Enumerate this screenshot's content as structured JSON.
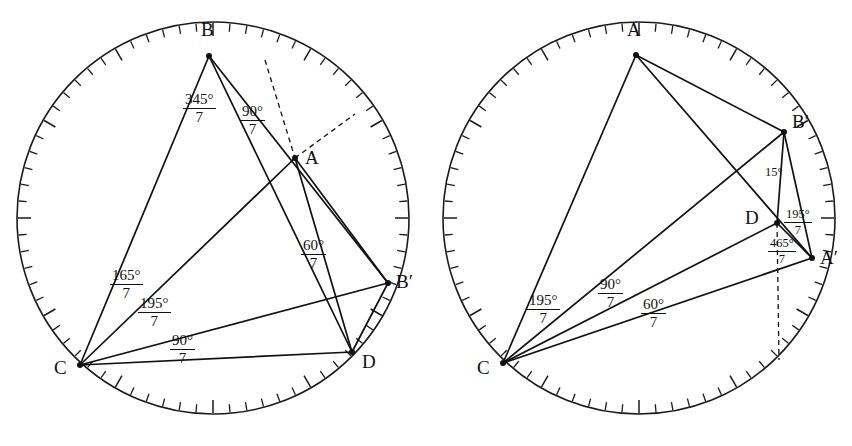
{
  "figure": {
    "stroke_color": "#111111",
    "background": "#ffffff",
    "width": 852,
    "height": 446
  },
  "left": {
    "name": "left-diagram",
    "circle": {
      "cx": 213,
      "cy": 218,
      "r": 196,
      "ticks": 72
    },
    "vertices": [
      {
        "id": "B",
        "label": "B",
        "x": 209,
        "y": 56,
        "lx": 201,
        "ly": 20
      },
      {
        "id": "A",
        "label": "A",
        "x": 295,
        "y": 158,
        "lx": 305,
        "ly": 148
      },
      {
        "id": "Bp",
        "label": "B′",
        "x": 388,
        "y": 283,
        "lx": 396,
        "ly": 272
      },
      {
        "id": "D",
        "label": "D",
        "x": 352,
        "y": 352,
        "lx": 362,
        "ly": 352
      },
      {
        "id": "C",
        "label": "C",
        "x": 80,
        "y": 365,
        "lx": 54,
        "ly": 358
      }
    ],
    "labels": [
      {
        "name": "angle-345-7",
        "numerator": "345°",
        "denominator": "7",
        "x": 183,
        "y": 92
      },
      {
        "name": "angle-90-7-b",
        "numerator": "90°",
        "denominator": "7",
        "x": 240,
        "y": 104
      },
      {
        "name": "angle-60-7",
        "numerator": "60°",
        "denominator": "7",
        "x": 301,
        "y": 238
      },
      {
        "name": "angle-165-7",
        "numerator": "165°",
        "denominator": "7",
        "x": 110,
        "y": 268
      },
      {
        "name": "angle-195-7",
        "numerator": "195°",
        "denominator": "7",
        "x": 138,
        "y": 296
      },
      {
        "name": "angle-90-7-c",
        "numerator": "90°",
        "denominator": "7",
        "x": 170,
        "y": 333
      }
    ]
  },
  "right": {
    "name": "right-diagram",
    "circle": {
      "cx": 639,
      "cy": 218,
      "r": 196,
      "ticks": 72
    },
    "vertices": [
      {
        "id": "A",
        "label": "A",
        "x": 636,
        "y": 55,
        "lx": 627,
        "ly": 20
      },
      {
        "id": "Bp",
        "label": "B′",
        "x": 784,
        "y": 132,
        "lx": 792,
        "ly": 112
      },
      {
        "id": "D",
        "label": "D",
        "x": 777,
        "y": 223,
        "lx": 745,
        "ly": 208
      },
      {
        "id": "Ap",
        "label": "A′",
        "x": 812,
        "y": 258,
        "lx": 820,
        "ly": 248
      },
      {
        "id": "C",
        "label": "C",
        "x": 503,
        "y": 363,
        "lx": 477,
        "ly": 358
      }
    ],
    "labels": [
      {
        "name": "angle-15",
        "text": "15°",
        "x": 765,
        "y": 165
      },
      {
        "name": "angle-195-7-d",
        "numerator": "195°",
        "denominator": "7",
        "x": 784,
        "y": 208
      },
      {
        "name": "angle-465-7",
        "numerator": "465°",
        "denominator": "7",
        "x": 768,
        "y": 237
      },
      {
        "name": "angle-195-7-c",
        "numerator": "195°",
        "denominator": "7",
        "x": 527,
        "y": 293
      },
      {
        "name": "angle-90-7",
        "numerator": "90°",
        "denominator": "7",
        "x": 598,
        "y": 277
      },
      {
        "name": "angle-60-7",
        "numerator": "60°",
        "denominator": "7",
        "x": 641,
        "y": 297
      }
    ]
  }
}
